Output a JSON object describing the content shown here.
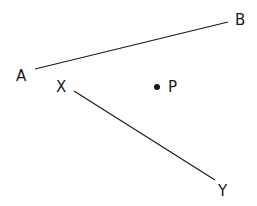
{
  "diagram": {
    "segments": [
      {
        "id": "AB",
        "from": "A",
        "to": "B"
      },
      {
        "id": "XY",
        "from": "X",
        "to": "Y"
      }
    ],
    "points": [
      {
        "id": "P",
        "label": "P",
        "marked": true
      }
    ],
    "labels": {
      "A": "A",
      "B": "B",
      "X": "X",
      "Y": "Y",
      "P": "P"
    },
    "color": "#1a1a1a"
  }
}
